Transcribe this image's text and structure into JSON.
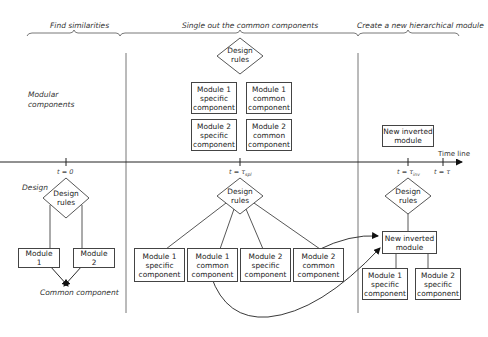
{
  "phases": [
    {
      "label": "Find similarities"
    },
    {
      "label": "Single out the common components"
    },
    {
      "label": "Create a new hierarchical module"
    }
  ],
  "row_labels": {
    "modular_line1": "Modular",
    "modular_line2": "components",
    "design": "Design"
  },
  "timeline": {
    "label": "Time line",
    "ticks": [
      {
        "var": "t",
        "eq": "=",
        "val": "0",
        "sub": ""
      },
      {
        "var": "t",
        "eq": "=",
        "val": "τ",
        "sub": "spl"
      },
      {
        "var": "t",
        "eq": "=",
        "val": "τ",
        "sub": "inv"
      },
      {
        "var": "t",
        "eq": "=",
        "val": "τ",
        "sub": ""
      }
    ]
  },
  "design_rules": {
    "line1": "Design",
    "line2": "rules"
  },
  "phase1": {
    "module1": {
      "line1": "Module",
      "line2": "1"
    },
    "module2": {
      "line1": "Module",
      "line2": "2"
    },
    "common_component": "Common component"
  },
  "phase2": {
    "top_boxes": [
      {
        "l1": "Module 1",
        "l2": "specific",
        "l3": "component"
      },
      {
        "l1": "Module 1",
        "l2": "common",
        "l3": "component"
      },
      {
        "l1": "Module 2",
        "l2": "specific",
        "l3": "component"
      },
      {
        "l1": "Module 2",
        "l2": "common",
        "l3": "component"
      }
    ],
    "bottom_boxes": [
      {
        "l1": "Module 1",
        "l2": "specific",
        "l3": "component"
      },
      {
        "l1": "Module 1",
        "l2": "common",
        "l3": "component"
      },
      {
        "l1": "Module 2",
        "l2": "specific",
        "l3": "component"
      },
      {
        "l1": "Module 2",
        "l2": "common",
        "l3": "component"
      }
    ]
  },
  "phase3": {
    "top_module": {
      "line1": "New inverted",
      "line2": "module"
    },
    "inverted_module": {
      "line1": "New inverted",
      "line2": "module"
    },
    "children": [
      {
        "l1": "Module 1",
        "l2": "specific",
        "l3": "component"
      },
      {
        "l1": "Module 2",
        "l2": "specific",
        "l3": "component"
      }
    ]
  }
}
